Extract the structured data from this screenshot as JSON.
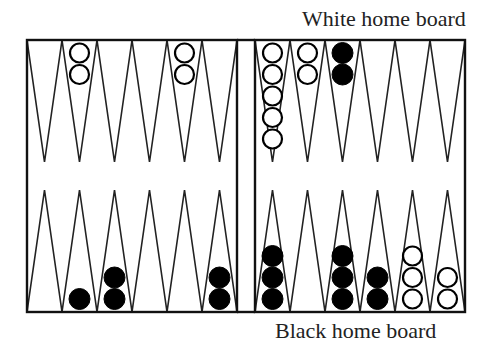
{
  "labels": {
    "top": "White home board",
    "bottom": "Black home board"
  },
  "colors": {
    "line": "#222222",
    "white_checker_fill": "#ffffff",
    "black_checker_fill": "#000000",
    "background": "#ffffff"
  },
  "board": {
    "frame": {
      "left": 27,
      "right": 465,
      "top": 40,
      "bottom": 312
    },
    "bar": {
      "left_edge": 237,
      "right_edge": 255
    },
    "point_width": 35,
    "top_tip_y": 162,
    "bottom_tip_y": 190
  },
  "points": {
    "top_left": [
      {
        "color": null,
        "count": 0
      },
      {
        "color": "white",
        "count": 2
      },
      {
        "color": null,
        "count": 0
      },
      {
        "color": null,
        "count": 0
      },
      {
        "color": "white",
        "count": 2
      },
      {
        "color": null,
        "count": 0
      }
    ],
    "top_right": [
      {
        "color": "white",
        "count": 5
      },
      {
        "color": "white",
        "count": 2
      },
      {
        "color": "black",
        "count": 2
      },
      {
        "color": null,
        "count": 0
      },
      {
        "color": null,
        "count": 0
      },
      {
        "color": null,
        "count": 0
      }
    ],
    "bottom_left": [
      {
        "color": null,
        "count": 0
      },
      {
        "color": "black",
        "count": 1
      },
      {
        "color": "black",
        "count": 2
      },
      {
        "color": null,
        "count": 0
      },
      {
        "color": null,
        "count": 0
      },
      {
        "color": "black",
        "count": 2
      }
    ],
    "bottom_right": [
      {
        "color": "black",
        "count": 3
      },
      {
        "color": null,
        "count": 0
      },
      {
        "color": "black",
        "count": 3
      },
      {
        "color": "black",
        "count": 2
      },
      {
        "color": "white",
        "count": 3
      },
      {
        "color": "white",
        "count": 2
      }
    ]
  }
}
